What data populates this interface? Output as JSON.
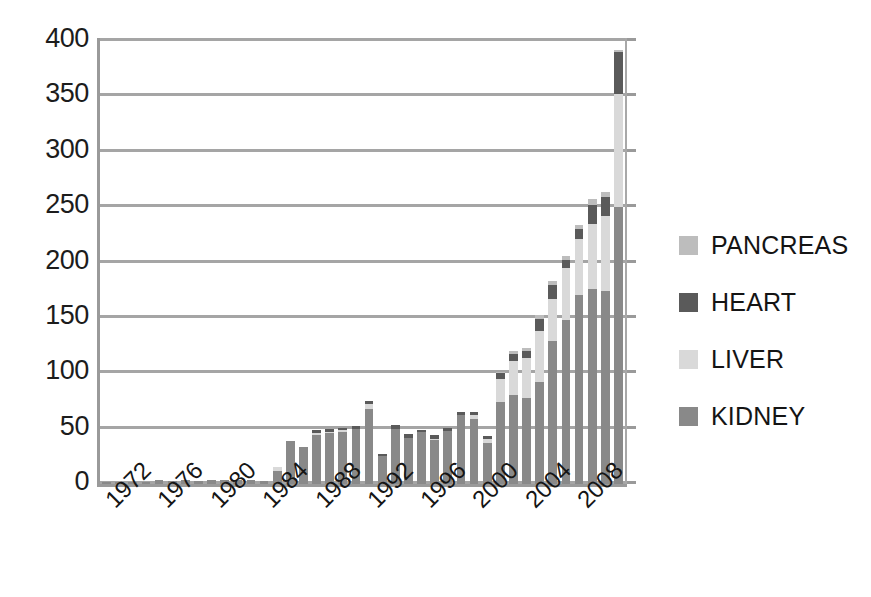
{
  "chart_data": {
    "type": "bar",
    "stacked": true,
    "title": "",
    "subtitle": "",
    "xlabel": "",
    "ylabel": "",
    "ylim": [
      0,
      400
    ],
    "ytick_step": 50,
    "ytick_labels": [
      "400",
      "350",
      "300",
      "250",
      "200",
      "150",
      "100",
      "50",
      "0"
    ],
    "ytick_values": [
      400,
      350,
      300,
      250,
      200,
      150,
      100,
      50,
      0
    ],
    "grid": true,
    "grid_axis": "y",
    "legend_position": "right",
    "legend_entries": [
      "PANCREAS",
      "HEART",
      "LIVER",
      "KIDNEY"
    ],
    "x": [
      1972,
      1973,
      1974,
      1975,
      1976,
      1977,
      1978,
      1979,
      1980,
      1981,
      1982,
      1983,
      1984,
      1985,
      1986,
      1987,
      1988,
      1989,
      1990,
      1991,
      1992,
      1993,
      1994,
      1995,
      1996,
      1997,
      1998,
      1999,
      2000,
      2001,
      2002,
      2003,
      2004,
      2005,
      2006,
      2007,
      2008,
      2009,
      2010,
      2011
    ],
    "categories": [
      "1972",
      "1973",
      "1974",
      "1975",
      "1976",
      "1977",
      "1978",
      "1979",
      "1980",
      "1981",
      "1982",
      "1983",
      "1984",
      "1985",
      "1986",
      "1987",
      "1988",
      "1989",
      "1990",
      "1991",
      "1992",
      "1993",
      "1994",
      "1995",
      "1996",
      "1997",
      "1998",
      "1999",
      "2000",
      "2001",
      "2002",
      "2003",
      "2004",
      "2005",
      "2006",
      "2007",
      "2008",
      "2009",
      "2010",
      "2011"
    ],
    "xtick_labels_shown": [
      "1972",
      "1976",
      "1980",
      "1984",
      "1988",
      "1992",
      "1996",
      "2000",
      "2004",
      "2008"
    ],
    "xtick_interval": 4,
    "xtick_rotation": -45,
    "series": [
      {
        "name": "KIDNEY",
        "color": "#898989",
        "values": [
          2,
          2,
          2,
          2,
          4,
          3,
          4,
          3,
          4,
          4,
          4,
          4,
          3,
          12,
          39,
          33,
          44,
          46,
          47,
          50,
          68,
          25,
          50,
          42,
          47,
          40,
          48,
          62,
          59,
          37,
          74,
          80,
          78,
          92,
          129,
          148,
          171,
          176,
          174,
          250
        ]
      },
      {
        "name": "LIVER",
        "color": "#d9d9d9",
        "values": [
          0,
          0,
          0,
          0,
          0,
          0,
          0,
          0,
          0,
          0,
          0,
          0,
          0,
          3,
          0,
          0,
          2,
          1,
          2,
          0,
          4,
          0,
          0,
          0,
          0,
          1,
          0,
          0,
          3,
          4,
          21,
          31,
          36,
          46,
          38,
          47,
          50,
          59,
          68,
          102
        ]
      },
      {
        "name": "HEART",
        "color": "#5a5a5a",
        "values": [
          0,
          0,
          0,
          0,
          0,
          0,
          0,
          0,
          0,
          0,
          0,
          0,
          0,
          0,
          0,
          0,
          3,
          3,
          2,
          2,
          3,
          2,
          3,
          3,
          2,
          3,
          3,
          3,
          3,
          2,
          5,
          6,
          6,
          11,
          13,
          7,
          9,
          17,
          17,
          38
        ]
      },
      {
        "name": "PANCREAS",
        "color": "#bdbdbd",
        "values": [
          0,
          0,
          0,
          0,
          0,
          0,
          0,
          0,
          0,
          0,
          0,
          0,
          0,
          0,
          0,
          0,
          0,
          0,
          0,
          0,
          0,
          0,
          0,
          0,
          0,
          0,
          0,
          0,
          0,
          0,
          1,
          3,
          3,
          4,
          3,
          4,
          4,
          5,
          5,
          2
        ]
      }
    ],
    "totals": [
      2,
      2,
      2,
      2,
      4,
      3,
      4,
      3,
      4,
      4,
      4,
      4,
      3,
      15,
      39,
      33,
      49,
      50,
      51,
      52,
      75,
      27,
      53,
      45,
      49,
      44,
      51,
      65,
      65,
      43,
      101,
      120,
      123,
      153,
      183,
      206,
      234,
      257,
      264,
      392
    ]
  },
  "axis": {
    "y_labels": [
      "400",
      "350",
      "300",
      "250",
      "200",
      "150",
      "100",
      "50",
      "0"
    ],
    "x_labels": [
      "1972",
      "1976",
      "1980",
      "1984",
      "1988",
      "1992",
      "1996",
      "2000",
      "2004",
      "2008"
    ]
  },
  "legend": {
    "items": [
      {
        "label": "PANCREAS",
        "color": "#bdbdbd"
      },
      {
        "label": "HEART",
        "color": "#5a5a5a"
      },
      {
        "label": "LIVER",
        "color": "#d9d9d9"
      },
      {
        "label": "KIDNEY",
        "color": "#898989"
      }
    ]
  },
  "colors": {
    "pancreas": "#bdbdbd",
    "heart": "#5a5a5a",
    "liver": "#d9d9d9",
    "kidney": "#898989",
    "grid": "#a5a5a5",
    "axis": "#9a9a9a",
    "text": "#1a1a1a",
    "background": "#ffffff"
  }
}
